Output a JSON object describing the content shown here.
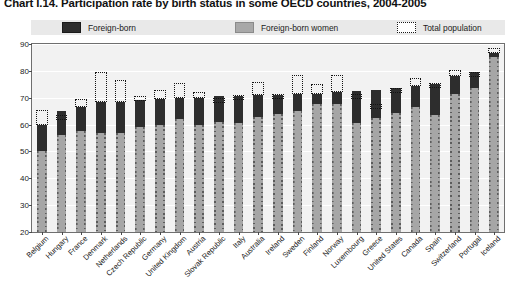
{
  "title": "Chart I.14.  Participation rate by birth status in some OECD countries, 2004-2005",
  "legend": {
    "items": [
      {
        "label": "Foreign-born",
        "swatch": "dark-square-icon",
        "color": "#2d2d2d"
      },
      {
        "label": "Foreign-born women",
        "swatch": "gray-square-icon",
        "color": "#a6a6a6"
      },
      {
        "label": "Total population",
        "swatch": "dotted-square-icon",
        "color": "#141414"
      }
    ]
  },
  "chart_data": {
    "type": "bar",
    "title": "Chart I.14.  Participation rate by birth status in some OECD countries, 2004-2005",
    "xlabel": "",
    "ylabel": "",
    "ylim": [
      20,
      90
    ],
    "yticks": [
      20,
      30,
      40,
      50,
      60,
      70,
      80,
      90
    ],
    "grid": true,
    "legend_position": "top",
    "categories": [
      "Belgium",
      "Hungary",
      "France",
      "Denmark",
      "Netherlands",
      "Czech Republic",
      "Germany",
      "United Kingdom",
      "Austria",
      "Slovak Republic",
      "Italy",
      "Australia",
      "Ireland",
      "Sweden",
      "Finland",
      "Norway",
      "Luxembourg",
      "Greece",
      "United States",
      "Canada",
      "Spain",
      "Switzerland",
      "Portugal",
      "Iceland"
    ],
    "series": [
      {
        "name": "Foreign-born",
        "color": "#2d2d2d",
        "values": [
          60,
          65,
          66.5,
          68.5,
          68.5,
          69,
          69.5,
          70,
          70,
          70.5,
          70.5,
          71,
          71,
          71.5,
          71.5,
          72,
          72.5,
          73,
          73.5,
          74.5,
          75,
          78,
          79.5,
          86.5
        ]
      },
      {
        "name": "Foreign-born women",
        "color": "#a6a6a6",
        "values": [
          50,
          56,
          57.5,
          57,
          57,
          59,
          60,
          62,
          60,
          61,
          60.5,
          63,
          64,
          65,
          67.5,
          67.5,
          60.5,
          62.5,
          64.5,
          66.5,
          63.5,
          71.5,
          73.5,
          85
        ]
      },
      {
        "name": "Total population",
        "color": "#141414",
        "style": "dotted-outline",
        "values": [
          65.5,
          63.5,
          69.5,
          79.5,
          76.5,
          70.5,
          73,
          75.5,
          72,
          70,
          71,
          76,
          71.5,
          78.5,
          75,
          78.5,
          71.5,
          67.5,
          73.5,
          77.5,
          75.5,
          80.5,
          79.5,
          88.5
        ]
      }
    ]
  }
}
